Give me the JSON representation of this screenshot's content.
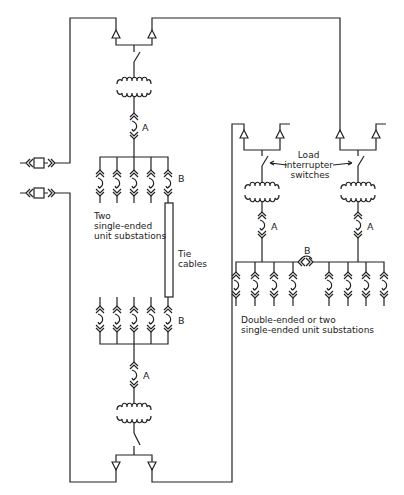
{
  "diagram": {
    "type": "one-line electrical distribution diagram",
    "labels": {
      "left_unit_substations": [
        "Two",
        "single-ended",
        "unit substations"
      ],
      "tie_cables": [
        "Tie",
        "cables"
      ],
      "load_interrupter": [
        "Load",
        "interrupter",
        "switches"
      ],
      "right_unit_substations": [
        "Double-ended or two",
        "single-ended unit substations"
      ],
      "connector_a": "A",
      "connector_b": "B"
    },
    "components": {
      "left_unit_substation_upper": {
        "feeders": 5,
        "transformer": true,
        "switch": true,
        "potheads": 2
      },
      "left_unit_substation_lower": {
        "feeders": 5,
        "transformer": true,
        "switch": true,
        "potheads": 2
      },
      "right_double_ended_substation": {
        "sections": 2,
        "feeders_per_section": 4,
        "tie_connector": "B"
      },
      "source_connectors": 2
    },
    "colors": {
      "line": "#222222",
      "background": "#ffffff"
    }
  }
}
